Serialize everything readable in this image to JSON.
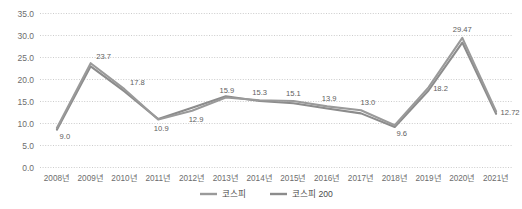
{
  "chart_data": {
    "type": "line",
    "title": "",
    "xlabel": "",
    "ylabel": "",
    "ylim": [
      0.0,
      35.0
    ],
    "ytick_labels": [
      "0.0",
      "5.0",
      "10.0",
      "15.0",
      "20.0",
      "25.0",
      "30.0",
      "35.0"
    ],
    "ytick_values": [
      0.0,
      5.0,
      10.0,
      15.0,
      20.0,
      25.0,
      30.0,
      35.0
    ],
    "grid": true,
    "grid_style": "dotted-horizontal",
    "legend_position": "bottom-center",
    "categories": [
      "2008년",
      "2009년",
      "2010년",
      "2011년",
      "2012년",
      "2013년",
      "2014년",
      "2015년",
      "2016년",
      "2017년",
      "2018년",
      "2019년",
      "2020년",
      "2021년"
    ],
    "series": [
      {
        "name": "코스피",
        "color": "#9a9a9a",
        "values": [
          9.0,
          23.7,
          17.8,
          10.9,
          12.9,
          15.9,
          15.3,
          15.1,
          13.9,
          13.0,
          9.6,
          18.2,
          29.47,
          12.72
        ],
        "data_labels": [
          "9.0",
          "23.7",
          "17.8",
          "10.9",
          "12.9",
          "15.9",
          "15.3",
          "15.1",
          "13.9",
          "13.0",
          "9.6",
          "18.2",
          "29.47",
          "12.72"
        ]
      },
      {
        "name": "코스피 200",
        "color": "#8c8c8c",
        "values": [
          8.6,
          23.0,
          17.3,
          11.0,
          13.6,
          16.2,
          15.1,
          14.6,
          13.4,
          12.3,
          9.2,
          17.5,
          28.4,
          12.2
        ],
        "data_labels": []
      }
    ]
  },
  "legend": {
    "entries": [
      {
        "label": "코스피"
      },
      {
        "label": "코스피 200"
      }
    ]
  }
}
